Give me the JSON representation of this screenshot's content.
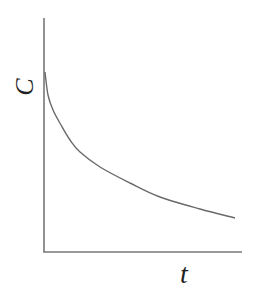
{
  "chart_data": {
    "type": "line",
    "title": "",
    "xlabel": "t",
    "ylabel": "C",
    "grid": false,
    "legend": null,
    "axis_ticks": {
      "x": [],
      "y": []
    },
    "series": [
      {
        "name": "C(t)",
        "normalized_points": [
          {
            "t": 0.0,
            "C": 0.77
          },
          {
            "t": 0.02,
            "C": 0.67
          },
          {
            "t": 0.05,
            "C": 0.6
          },
          {
            "t": 0.09,
            "C": 0.54
          },
          {
            "t": 0.13,
            "C": 0.48
          },
          {
            "t": 0.18,
            "C": 0.43
          },
          {
            "t": 0.28,
            "C": 0.36
          },
          {
            "t": 0.44,
            "C": 0.29
          },
          {
            "t": 0.59,
            "C": 0.24
          },
          {
            "t": 0.79,
            "C": 0.18
          },
          {
            "t": 0.97,
            "C": 0.14
          }
        ]
      }
    ],
    "xlim": [
      0,
      1
    ],
    "ylim": [
      0,
      1
    ]
  },
  "plot_area": {
    "x0": 44,
    "y0": 252,
    "x1": 242,
    "y_top": 18
  },
  "curve_pixels": [
    [
      45,
      72
    ],
    [
      48,
      95
    ],
    [
      53,
      110
    ],
    [
      61,
      125
    ],
    [
      70,
      140
    ],
    [
      80,
      152
    ],
    [
      100,
      167
    ],
    [
      130,
      183
    ],
    [
      160,
      197
    ],
    [
      200,
      209
    ],
    [
      235,
      218
    ]
  ],
  "labels": {
    "y": "C",
    "x": "t"
  },
  "colors": {
    "axis": "#777777",
    "curve": "#6a6a6a",
    "text": "#222222"
  }
}
